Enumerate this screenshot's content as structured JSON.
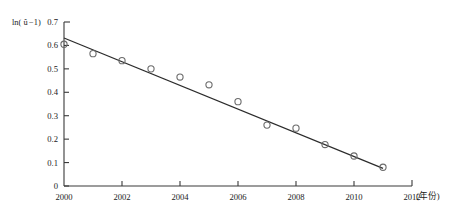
{
  "chart_data": {
    "type": "scatter",
    "title": "",
    "subtitle": "",
    "xlabel": "(年份)",
    "ylabel": "ln(û−1)",
    "ylabel_parts": {
      "prefix": "ln(",
      "variable": "û",
      "suffix": "−1)"
    },
    "x": [
      2000,
      2001,
      2002,
      2003,
      2004,
      2005,
      2006,
      2007,
      2008,
      2009,
      2010,
      2011
    ],
    "values": [
      0.605,
      0.565,
      0.535,
      0.5,
      0.465,
      0.432,
      0.36,
      0.26,
      0.247,
      0.177,
      0.128,
      0.08
    ],
    "series": [
      {
        "name": "观测值",
        "marker": "open-circle",
        "values": [
          0.605,
          0.565,
          0.535,
          0.5,
          0.465,
          0.432,
          0.36,
          0.26,
          0.247,
          0.177,
          0.128,
          0.08
        ]
      }
    ],
    "trendline": {
      "type": "linear",
      "x_start": 2000,
      "y_start": 0.632,
      "x_end": 2011,
      "y_end": 0.075,
      "slope": -0.0506,
      "intercept": 0.632
    },
    "xlim": [
      2000,
      2012
    ],
    "ylim": [
      0,
      0.7
    ],
    "xticks": [
      2000,
      2002,
      2004,
      2006,
      2008,
      2010,
      2012
    ],
    "xtick_labels": [
      "2000",
      "2002",
      "2004",
      "2006",
      "2008",
      "2010",
      "2012"
    ],
    "yticks": [
      0,
      0.1,
      0.2,
      0.3,
      0.4,
      0.5,
      0.6,
      0.7
    ],
    "ytick_labels": [
      "0",
      "0.1",
      "0.2",
      "0.3",
      "0.4",
      "0.5",
      "0.6",
      "0.7"
    ],
    "grid": false,
    "legend": "none",
    "colors": {
      "axis": "#3a3a3a",
      "line": "#2b2b2b",
      "marker": "#6b6b6b",
      "background": "#ffffff"
    }
  }
}
